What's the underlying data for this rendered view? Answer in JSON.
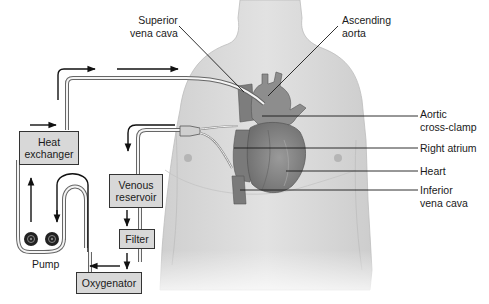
{
  "diagram": {
    "anatomy_labels": {
      "superior_vena_cava": [
        "Superior",
        "vena cava"
      ],
      "ascending_aorta": [
        "Ascending",
        "aorta"
      ],
      "aortic_cross_clamp": [
        "Aortic",
        "cross-clamp"
      ],
      "right_atrium": "Right atrium",
      "heart": "Heart",
      "inferior_vena_cava": [
        "Inferior",
        "vena cava"
      ]
    },
    "circuit_components": {
      "heat_exchanger": [
        "Heat",
        "exchanger"
      ],
      "venous_reservoir": [
        "Venous",
        "reservoir"
      ],
      "filter": "Filter",
      "oxygenator": "Oxygenator",
      "pump": "Pump"
    },
    "colors": {
      "skin": "#d9d9d9",
      "heart": "#8a8a8a",
      "box_fill": "#d8d8d8",
      "line": "#1a1a1a"
    }
  }
}
